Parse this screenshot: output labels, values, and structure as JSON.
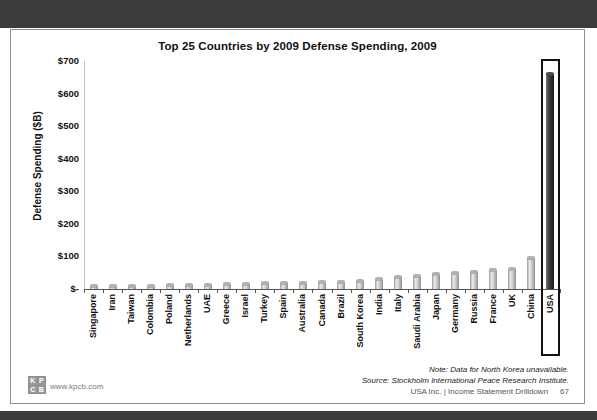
{
  "top_banner": {
    "color": "#3c3c3c"
  },
  "slide": {
    "footer": {
      "note_line1": "Note: Data for North Korea unavailable.",
      "note_line2": "Source: Stockholm International Peace Research Institute.",
      "brand_line": "USA Inc. | Income Statement Drilldown",
      "page_number": "67",
      "logo_letters": [
        "K",
        "P",
        "C",
        "B"
      ],
      "logo_url": "www.kpcb.com"
    }
  },
  "chart_data": {
    "type": "bar",
    "title": "Top 25 Countries by 2009 Defense Spending, 2009",
    "xlabel": "",
    "ylabel": "Defense Spending ($B)",
    "units": "USD billions (estimated from bar heights; no data labels shown)",
    "ylim": [
      0,
      700
    ],
    "ytick_values": [
      0,
      100,
      200,
      300,
      400,
      500,
      600,
      700
    ],
    "ytick_labels": [
      "$-",
      "$100",
      "$200",
      "$300",
      "$400",
      "$500",
      "$600",
      "$700"
    ],
    "grid": false,
    "legend": false,
    "highlighted_category": "USA",
    "categories": [
      "Singapore",
      "Iran",
      "Taiwan",
      "Colombia",
      "Poland",
      "Netherlands",
      "UAE",
      "Greece",
      "Israel",
      "Turkey",
      "Spain",
      "Australia",
      "Canada",
      "Brazil",
      "South Korea",
      "India",
      "Italy",
      "Saudi Arabia",
      "Japan",
      "Germany",
      "Russia",
      "France",
      "UK",
      "China",
      "USA"
    ],
    "values": [
      8,
      9,
      10,
      10,
      11,
      12,
      13,
      14,
      15,
      17,
      18,
      19,
      20,
      23,
      25,
      30,
      36,
      41,
      47,
      49,
      53,
      58,
      61,
      95,
      661
    ],
    "colors": {
      "bar": "#c9c9c9",
      "highlight_bar": "#3a3a3a",
      "banner": "#3c3c3c"
    }
  }
}
